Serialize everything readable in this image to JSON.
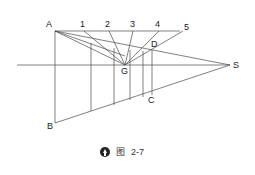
{
  "diagram": {
    "points": {
      "A": {
        "label": "A"
      },
      "B": {
        "label": "B"
      },
      "C": {
        "label": "C"
      },
      "D": {
        "label": "D"
      },
      "G": {
        "label": "G"
      },
      "S": {
        "label": "S"
      }
    },
    "top_labels": [
      "1",
      "2",
      "3",
      "4",
      "5"
    ],
    "line_color": "#4a4a4a"
  },
  "caption": {
    "icon": "up-arrow-circle-icon",
    "figure_word": "图",
    "figure_number": "2-7"
  }
}
